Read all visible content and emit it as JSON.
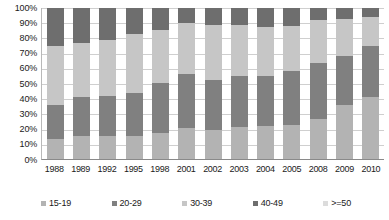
{
  "chart_data": {
    "type": "bar",
    "subtype": "stacked-100-percent",
    "title": "",
    "xlabel": "",
    "ylabel": "",
    "ylim": [
      0,
      100
    ],
    "ytick_labels": [
      "100%",
      "90%",
      "80%",
      "70%",
      "60%",
      "50%",
      "40%",
      "30%",
      "20%",
      "10%",
      "0%"
    ],
    "ytick_values": [
      100,
      90,
      80,
      70,
      60,
      50,
      40,
      30,
      20,
      10,
      0
    ],
    "grid": true,
    "grid_axis": "y",
    "legend_position": "bottom",
    "categories": [
      "1988",
      "1989",
      "1992",
      "1995",
      "1998",
      "2001",
      "2002",
      "2003",
      "2004",
      "2005",
      "2008",
      "2009",
      "2010"
    ],
    "series": [
      {
        "name": "15-19",
        "color": "#b3b3b3",
        "values": [
          13.5,
          15.5,
          15.5,
          15.0,
          17.0,
          20.5,
          19.5,
          21.0,
          22.0,
          22.5,
          26.5,
          36.0,
          41.0
        ]
      },
      {
        "name": "20-29",
        "color": "#808080",
        "values": [
          22.5,
          25.5,
          26.0,
          29.0,
          33.5,
          36.0,
          33.0,
          34.0,
          33.0,
          36.0,
          37.0,
          32.0,
          34.0
        ]
      },
      {
        "name": "30-39",
        "color": "#c6c6c6",
        "values": [
          39.0,
          36.0,
          37.5,
          39.0,
          35.0,
          33.5,
          36.0,
          34.0,
          32.5,
          29.5,
          28.5,
          25.0,
          19.0
        ]
      },
      {
        "name": "40-49",
        "color": "#6e6e6e",
        "values": [
          25.0,
          23.0,
          21.0,
          17.0,
          14.5,
          10.0,
          11.5,
          11.0,
          12.5,
          12.0,
          8.0,
          7.0,
          6.0
        ]
      },
      {
        "name": ">=50",
        "color": "#dcdcdc",
        "values": [
          0,
          0,
          0,
          0,
          0,
          0,
          0,
          0,
          0,
          0,
          0,
          0,
          0
        ]
      }
    ],
    "cumulative_tops": [
      [
        13.5,
        36.0,
        75.0,
        100.0,
        100.0
      ],
      [
        15.5,
        41.0,
        77.0,
        100.0,
        100.0
      ],
      [
        15.5,
        41.5,
        79.0,
        100.0,
        100.0
      ],
      [
        15.0,
        44.0,
        83.0,
        100.0,
        100.0
      ],
      [
        17.0,
        50.5,
        85.5,
        100.0,
        100.0
      ],
      [
        20.5,
        56.5,
        90.0,
        100.0,
        100.0
      ],
      [
        19.5,
        52.5,
        88.5,
        100.0,
        100.0
      ],
      [
        21.0,
        55.0,
        89.0,
        100.0,
        100.0
      ],
      [
        22.0,
        55.0,
        87.5,
        100.0,
        100.0
      ],
      [
        22.5,
        58.5,
        88.0,
        100.0,
        100.0
      ],
      [
        26.5,
        63.5,
        92.0,
        100.0,
        100.0
      ],
      [
        36.0,
        68.0,
        93.0,
        100.0,
        100.0
      ],
      [
        41.0,
        75.0,
        94.0,
        100.0,
        100.0
      ]
    ]
  },
  "legend": {
    "items": [
      {
        "label": "15-19",
        "color": "#b3b3b3",
        "icon": "square-marker-icon"
      },
      {
        "label": "20-29",
        "color": "#808080",
        "icon": "square-marker-icon"
      },
      {
        "label": "30-39",
        "color": "#c6c6c6",
        "icon": "square-marker-icon"
      },
      {
        "label": "40-49",
        "color": "#6e6e6e",
        "icon": "square-marker-icon"
      },
      {
        "label": ">=50",
        "color": "#dcdcdc",
        "icon": "square-marker-icon"
      }
    ]
  },
  "colors": {
    "grid": "#cfcfcf",
    "axis": "#8a8a8a",
    "text": "#1a1a1a",
    "background": "#ffffff"
  }
}
